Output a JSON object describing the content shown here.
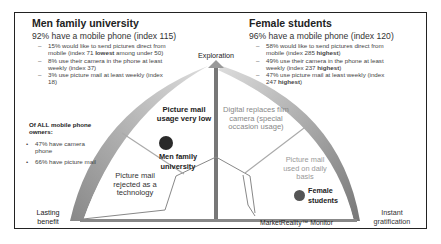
{
  "left_panel": {
    "title": "Men family university",
    "headline": "92% have a mobile phone (index 115)",
    "bullets": [
      {
        "pre": "15% would like to send pictures direct from mobile (index 71 ",
        "bold": "lowest",
        "post": " among under 50)"
      },
      {
        "pre": "8% use their camera in the phone at least weekly (index 37)",
        "bold": "",
        "post": ""
      },
      {
        "pre": "3% use picture mail at least weekly (index 18)",
        "bold": "",
        "post": ""
      }
    ]
  },
  "right_panel": {
    "title": "Female students",
    "headline": "96% have a mobile phone (index 120)",
    "bullets": [
      {
        "pre": "58% would like to send pictures direct from mobile (index 285 ",
        "bold": "highest",
        "post": ")"
      },
      {
        "pre": "49% use their camera in the phone at least weekly (index 237 ",
        "bold": "highest",
        "post": ")"
      },
      {
        "pre": "47% use picture mail at least weekly (index 247 ",
        "bold": "highest",
        "post": ")"
      }
    ]
  },
  "all_owners": {
    "title": "Of ALL mobile phone owners:",
    "items": [
      "47% have camera phone",
      "66% have picture mail"
    ]
  },
  "axes": {
    "top": "Exploration",
    "bottom_left": "Lasting benefit",
    "bottom_right": "Instant gratification"
  },
  "segments": {
    "upper_left": "Picture mail usage very low",
    "upper_right": "Digital replaces film camera (special occasion usage)",
    "lower_left": "Picture mail rejected as a technology",
    "lower_right": "Picture mail used on daily basis"
  },
  "markers": {
    "men": {
      "label": "Men family university",
      "color": "#2a2a2a"
    },
    "female": {
      "label": "Female students",
      "color": "#555555"
    }
  },
  "footer": {
    "label": "MarketReality™ Monitor"
  }
}
